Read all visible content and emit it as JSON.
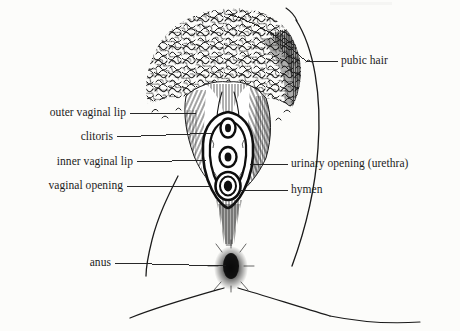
{
  "figure": {
    "style": "pen-and-ink line drawing",
    "background_color": "#fcfcfa",
    "ink_color": "#111111"
  },
  "labels": {
    "pubic_hair": "pubic hair",
    "outer_vaginal_lip": "outer vaginal lip",
    "clitoris": "clitoris",
    "inner_vaginal_lip": "inner vaginal lip",
    "vaginal_opening": "vaginal opening",
    "urinary_opening": "urinary opening (urethra)",
    "hymen": "hymen",
    "anus": "anus"
  }
}
